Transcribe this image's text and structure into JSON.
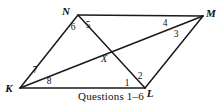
{
  "figure": {
    "name": "parallelogram-with-diagonals",
    "stroke_color": "#1a1a1a",
    "background_color": "#ffffff",
    "text_color": "#111111",
    "width": 222,
    "height": 108,
    "vertices": [
      {
        "id": "N",
        "label": "N",
        "x": 78,
        "y": 15,
        "label_x": 66,
        "label_y": 15
      },
      {
        "id": "M",
        "label": "M",
        "x": 203,
        "y": 16,
        "label_x": 207,
        "label_y": 17
      },
      {
        "id": "K",
        "label": "K",
        "x": 20,
        "y": 88,
        "label_x": 5,
        "label_y": 92
      },
      {
        "id": "L",
        "label": "L",
        "x": 145,
        "y": 88,
        "label_x": 147,
        "label_y": 97
      }
    ],
    "intersection": {
      "id": "X",
      "label": "X",
      "x": 105,
      "y": 52,
      "label_x": 102,
      "label_y": 62
    },
    "segments": [
      {
        "name": "side-NM",
        "from": "N",
        "to": "M"
      },
      {
        "name": "side-KL",
        "from": "K",
        "to": "L"
      },
      {
        "name": "side-KN",
        "from": "K",
        "to": "N"
      },
      {
        "name": "side-ML",
        "from": "M",
        "to": "L"
      },
      {
        "name": "diagonal-KM",
        "from": "K",
        "to": "M"
      },
      {
        "name": "diagonal-NL",
        "from": "N",
        "to": "L"
      }
    ],
    "angle_labels": [
      {
        "id": "angle-1",
        "label": "1",
        "x": 125,
        "y": 85,
        "at_vertex": "L"
      },
      {
        "id": "angle-2",
        "label": "2",
        "x": 138,
        "y": 79,
        "at_vertex": "L"
      },
      {
        "id": "angle-3",
        "label": "3",
        "x": 174,
        "y": 37,
        "at_vertex": "M"
      },
      {
        "id": "angle-4",
        "label": "4",
        "x": 163,
        "y": 26,
        "at_vertex": "M"
      },
      {
        "id": "angle-5",
        "label": "5",
        "x": 86,
        "y": 28,
        "at_vertex": "N"
      },
      {
        "id": "angle-6",
        "label": "6",
        "x": 71,
        "y": 30,
        "at_vertex": "N"
      },
      {
        "id": "angle-7",
        "label": "7",
        "x": 33,
        "y": 73,
        "at_vertex": "K"
      },
      {
        "id": "angle-8",
        "label": "8",
        "x": 47,
        "y": 84,
        "at_vertex": "K"
      }
    ]
  },
  "caption": {
    "text": "Questions 1–6"
  }
}
